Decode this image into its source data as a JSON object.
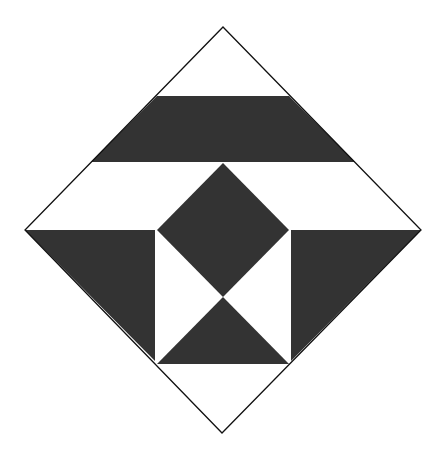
{
  "diagram": {
    "canvas": {
      "width": 448,
      "height": 453
    },
    "colors": {
      "background": "#ffffff",
      "dark": "#333333",
      "outline": "#111111"
    },
    "outline": {
      "name": "outer-diamond",
      "points": "223,27 421,230 222,433 25,230"
    },
    "shapes": [
      {
        "name": "top-band",
        "fill": "dark",
        "points": "157,96 289,96 355,162 91,162"
      },
      {
        "name": "center-diamond",
        "fill": "dark",
        "points": "223,163 289,230 223,297 157,230"
      },
      {
        "name": "bottom-triangle",
        "fill": "dark",
        "points": "223,297 289,364 157,364"
      },
      {
        "name": "left-triangle",
        "fill": "dark",
        "points": "25,230 155,230 155,361"
      },
      {
        "name": "right-triangle",
        "fill": "dark",
        "points": "291,230 421,230 291,361"
      }
    ],
    "inner_square": {
      "name": "inner-square",
      "points": "157,230 289,230 289,364 157,364"
    }
  }
}
